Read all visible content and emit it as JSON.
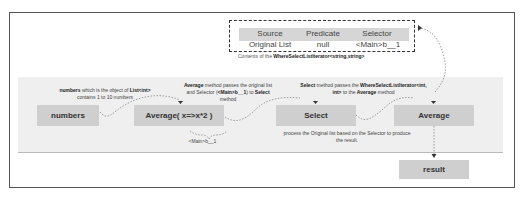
{
  "iterator_table": {
    "headers": [
      "Source",
      "Predicate",
      "Selector"
    ],
    "row": [
      "Original List",
      "null",
      "<Main>b__1"
    ],
    "caption_prefix": "Contents of the ",
    "caption_bold": "WhereSelectListIterator<string,string>"
  },
  "nodes": {
    "numbers": "numbers",
    "average_call": "Average( x=>x*2 )",
    "select": "Select",
    "average": "Average",
    "result": "result"
  },
  "notes": {
    "numbers": {
      "b1": "numbers",
      "t1": " which is  the object of ",
      "b2": "List<int>",
      "t2": "contains 1 to 10 numbers"
    },
    "average": {
      "b1": "Average",
      "t1": " method passes the original list",
      "t2": "and Selector (",
      "b2": "<Main>b__1",
      "t3": ") to ",
      "b3": "Select",
      "t4": "method"
    },
    "select": {
      "b1": "Select",
      "t1": " method passes the ",
      "b2": "WhereSelectListIterator<int,",
      "b3": "int>",
      "t2": " to the ",
      "b4": "Average",
      "t3": " method"
    },
    "lambda_label": "<Main>b__1",
    "process": {
      "l1": "process the Original list based on the Selector to produce",
      "l2": "the result."
    }
  }
}
